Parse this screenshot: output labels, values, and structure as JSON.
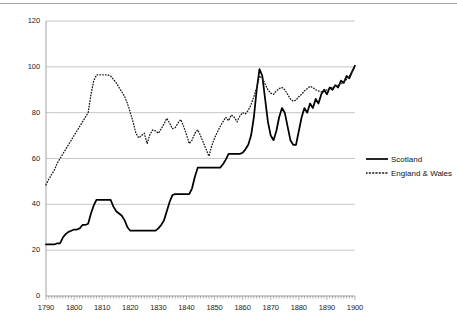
{
  "chart_data": {
    "type": "line",
    "title": "",
    "subtitle": "",
    "xlabel": "",
    "ylabel": "",
    "xlim": [
      1790,
      1900
    ],
    "ylim": [
      0,
      120
    ],
    "yticks": [
      "0",
      "20",
      "40",
      "60",
      "80",
      "100",
      "120"
    ],
    "ytick_values": [
      0,
      20,
      40,
      60,
      80,
      100,
      120
    ],
    "xticks": [
      "1790",
      "1800",
      "1810",
      "1820",
      "1830",
      "1840",
      "1850",
      "1860",
      "1870",
      "1880",
      "1890",
      "1900"
    ],
    "xtick_values": [
      1790,
      1800,
      1810,
      1820,
      1830,
      1840,
      1850,
      1860,
      1870,
      1880,
      1890,
      1900
    ],
    "grid": "horizontal",
    "legend_position": "right",
    "x": [
      1790,
      1791,
      1792,
      1793,
      1794,
      1795,
      1796,
      1797,
      1798,
      1799,
      1800,
      1801,
      1802,
      1803,
      1804,
      1805,
      1806,
      1807,
      1808,
      1809,
      1810,
      1811,
      1812,
      1813,
      1814,
      1815,
      1816,
      1817,
      1818,
      1819,
      1820,
      1821,
      1822,
      1823,
      1824,
      1825,
      1826,
      1827,
      1828,
      1829,
      1830,
      1831,
      1832,
      1833,
      1834,
      1835,
      1836,
      1837,
      1838,
      1839,
      1840,
      1841,
      1842,
      1843,
      1844,
      1845,
      1846,
      1847,
      1848,
      1849,
      1850,
      1851,
      1852,
      1853,
      1854,
      1855,
      1856,
      1857,
      1858,
      1859,
      1860,
      1861,
      1862,
      1863,
      1864,
      1865,
      1866,
      1867,
      1868,
      1869,
      1870,
      1871,
      1872,
      1873,
      1874,
      1875,
      1876,
      1877,
      1878,
      1879,
      1880,
      1881,
      1882,
      1883,
      1884,
      1885,
      1886,
      1887,
      1888,
      1889,
      1890,
      1891,
      1892,
      1893,
      1894,
      1895,
      1896,
      1897,
      1898,
      1899,
      1900
    ],
    "series": [
      {
        "name": "Scotland",
        "style": "solid",
        "color": "#000000",
        "values": [
          22.5,
          22.5,
          22.5,
          22.5,
          23.0,
          23.0,
          25.5,
          27.0,
          28.0,
          28.5,
          29.0,
          29.0,
          29.5,
          31.0,
          31.0,
          31.5,
          36.0,
          39.5,
          42.0,
          42.0,
          42.0,
          42.0,
          42.0,
          42.0,
          39.0,
          37.0,
          36.0,
          35.0,
          33.0,
          30.0,
          28.5,
          28.5,
          28.5,
          28.5,
          28.5,
          28.5,
          28.5,
          28.5,
          28.5,
          28.5,
          29.5,
          31.0,
          33.0,
          37.0,
          41.0,
          44.0,
          44.5,
          44.5,
          44.5,
          44.5,
          44.5,
          44.5,
          47.0,
          52.0,
          56.0,
          56.0,
          56.0,
          56.0,
          56.0,
          56.0,
          56.0,
          56.0,
          56.0,
          57.5,
          59.5,
          62.0,
          62.0,
          62.0,
          62.0,
          62.0,
          62.5,
          64.0,
          66.0,
          70.0,
          78.0,
          90.0,
          99.0,
          96.0,
          86.0,
          76.0,
          70.0,
          68.0,
          72.0,
          78.0,
          82.0,
          80.0,
          74.0,
          68.0,
          66.0,
          66.0,
          72.0,
          78.0,
          82.0,
          80.0,
          84.0,
          82.0,
          86.0,
          84.0,
          88.0,
          90.0,
          88.0,
          91.0,
          90.0,
          92.0,
          91.0,
          94.0,
          93.0,
          96.0,
          95.0,
          98.0,
          100.5
        ]
      },
      {
        "name": "England & Wales",
        "style": "dotted",
        "color": "#1a1a1a",
        "values": [
          48.5,
          51.0,
          53.0,
          55.0,
          58.0,
          60.0,
          62.0,
          64.0,
          66.0,
          68.0,
          70.0,
          72.0,
          74.0,
          76.0,
          78.0,
          80.0,
          88.0,
          94.0,
          96.5,
          96.5,
          96.5,
          96.5,
          96.5,
          96.0,
          94.5,
          93.0,
          91.0,
          89.0,
          87.0,
          84.0,
          80.0,
          76.0,
          71.0,
          69.0,
          70.0,
          71.0,
          66.5,
          70.5,
          72.5,
          72.0,
          71.0,
          73.0,
          75.0,
          77.5,
          75.5,
          73.0,
          73.5,
          75.5,
          77.0,
          74.0,
          70.5,
          66.5,
          68.0,
          71.0,
          72.5,
          70.0,
          67.0,
          64.0,
          61.0,
          65.5,
          69.0,
          71.5,
          74.0,
          76.0,
          78.0,
          76.5,
          79.0,
          78.0,
          76.0,
          78.5,
          80.0,
          79.5,
          81.0,
          83.5,
          87.0,
          91.0,
          96.0,
          95.0,
          92.5,
          90.0,
          88.5,
          88.0,
          89.5,
          90.5,
          91.0,
          90.0,
          88.0,
          86.0,
          85.0,
          85.5,
          87.0,
          88.0,
          89.5,
          90.5,
          91.5,
          91.0,
          90.0,
          89.5,
          89.0,
          89.5,
          90.0,
          90.5,
          91.0,
          91.5,
          92.0,
          92.5,
          93.5,
          94.5,
          96.0,
          98.0,
          100.0
        ]
      }
    ]
  },
  "legend": {
    "items": [
      {
        "label": "Scotland",
        "style": "solid"
      },
      {
        "label": "England & Wales",
        "style": "dotted"
      }
    ]
  }
}
